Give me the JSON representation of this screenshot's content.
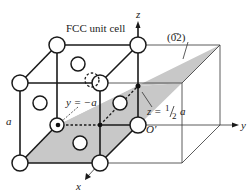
{
  "figure": {
    "title": "FCC unit cell",
    "plane_label": "(0̅2)",
    "plane_miller": "(0 -1 2)",
    "labels": {
      "edge_length": "a",
      "y_intercept": "y = −a",
      "z_intercept_prefix": "z = ",
      "z_intercept_num": "1",
      "z_intercept_den": "2",
      "z_intercept_suffix": "a",
      "origin": "O′",
      "x_axis": "x",
      "y_axis": "y",
      "z_axis": "z"
    },
    "colors": {
      "plane": "#c8c8c8",
      "lines": "#1a1a1a",
      "background": "#ffffff"
    }
  }
}
